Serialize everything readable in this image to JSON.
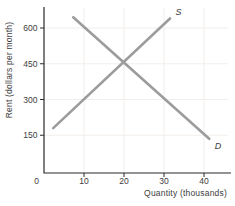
{
  "chart_data": {
    "type": "line",
    "title": "",
    "xlabel": "Quantity (thousands)",
    "ylabel": "Rent (dollars per month)",
    "origin_label": "0",
    "x_ticks": [
      10,
      20,
      30,
      40
    ],
    "y_ticks": [
      150,
      300,
      450,
      600
    ],
    "xlim": [
      0,
      46
    ],
    "ylim": [
      0,
      690
    ],
    "grid": true,
    "legend": "none",
    "series": [
      {
        "name": "supply",
        "label": "S",
        "points": [
          [
            2.3,
            180
          ],
          [
            31.5,
            640
          ]
        ]
      },
      {
        "name": "demand",
        "label": "D",
        "points": [
          [
            7.3,
            645
          ],
          [
            41.3,
            135
          ]
        ]
      }
    ],
    "equilibrium": {
      "quantity": 20,
      "rent": 450
    },
    "colors": {
      "line": "#9c9c9c",
      "axis": "#2b2b2b",
      "grid": "#f2eeea",
      "text": "#3d3d3d",
      "background": "#ffffff"
    }
  }
}
